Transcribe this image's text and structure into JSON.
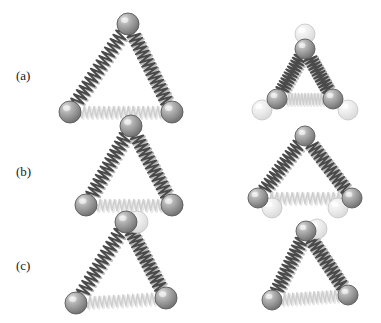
{
  "figure": {
    "title": "",
    "canvas": {
      "width": 381,
      "height": 323,
      "background": "#ffffff"
    },
    "row_labels": [
      {
        "id": "a",
        "text": "(a)",
        "x": 16,
        "y": 68
      },
      {
        "id": "b",
        "text": "(b)",
        "x": 16,
        "y": 164
      },
      {
        "id": "c",
        "text": "(c)",
        "x": 16,
        "y": 258
      }
    ],
    "colors": {
      "atom_dark": "#8c8c8c",
      "atom_dark_edge": "#5a5a5a",
      "atom_highlight": "#d8d8d8",
      "atom_pale": "#e2e2e2",
      "atom_pale_edge": "#bdbdbd",
      "spring_dark": "#4a4a4a",
      "spring_light": "#cfcfcf",
      "label_color": "#1a1a1a"
    },
    "panels": [
      {
        "id": "a-left",
        "row": "a",
        "side": "left",
        "shape": "triangle",
        "atoms": [
          {
            "id": "a-l-top",
            "cx": 128,
            "cy": 24,
            "r": 11,
            "tone": "dark"
          },
          {
            "id": "a-l-bottom-left",
            "cx": 70,
            "cy": 112,
            "r": 11,
            "tone": "dark"
          },
          {
            "id": "a-l-bottom-right",
            "cx": 172,
            "cy": 112,
            "r": 11,
            "tone": "dark"
          }
        ],
        "springs": [
          {
            "from": "a-l-top",
            "to": "a-l-bottom-left",
            "tone": "dark",
            "coils": 17
          },
          {
            "from": "a-l-top",
            "to": "a-l-bottom-right",
            "tone": "dark",
            "coils": 17
          },
          {
            "from": "a-l-bottom-left",
            "to": "a-l-bottom-right",
            "tone": "light",
            "coils": 17
          }
        ]
      },
      {
        "id": "a-right",
        "row": "a",
        "side": "right",
        "shape": "triangle-compressed",
        "atoms": [
          {
            "id": "a-r-top",
            "cx": 305,
            "cy": 49,
            "r": 10,
            "tone": "dark"
          },
          {
            "id": "a-r-bottom-left",
            "cx": 277,
            "cy": 99,
            "r": 10,
            "tone": "dark"
          },
          {
            "id": "a-r-bottom-right",
            "cx": 333,
            "cy": 99,
            "r": 10,
            "tone": "dark"
          },
          {
            "id": "a-r-ghost-left",
            "cx": 262,
            "cy": 110,
            "r": 10,
            "tone": "pale"
          },
          {
            "id": "a-r-ghost-right",
            "cx": 348,
            "cy": 110,
            "r": 10,
            "tone": "pale"
          },
          {
            "id": "a-r-ghost-top",
            "cx": 305,
            "cy": 34,
            "r": 10,
            "tone": "pale"
          }
        ],
        "springs": [
          {
            "from": "a-r-top",
            "to": "a-r-bottom-left",
            "tone": "dark",
            "coils": 12
          },
          {
            "from": "a-r-top",
            "to": "a-r-bottom-right",
            "tone": "dark",
            "coils": 12
          },
          {
            "from": "a-r-bottom-left",
            "to": "a-r-bottom-right",
            "tone": "light",
            "coils": 12
          }
        ]
      },
      {
        "id": "b-left",
        "row": "b",
        "side": "left",
        "shape": "triangle-sheared",
        "atoms": [
          {
            "id": "b-l-top",
            "cx": 131,
            "cy": 126,
            "r": 11,
            "tone": "dark"
          },
          {
            "id": "b-l-bottom-left",
            "cx": 86,
            "cy": 205,
            "r": 11,
            "tone": "dark"
          },
          {
            "id": "b-l-bottom-right",
            "cx": 172,
            "cy": 205,
            "r": 11,
            "tone": "dark"
          }
        ],
        "springs": [
          {
            "from": "b-l-top",
            "to": "b-l-bottom-left",
            "tone": "dark",
            "coils": 15
          },
          {
            "from": "b-l-top",
            "to": "b-l-bottom-right",
            "tone": "dark",
            "coils": 15
          },
          {
            "from": "b-l-bottom-left",
            "to": "b-l-bottom-right",
            "tone": "light",
            "coils": 14
          }
        ]
      },
      {
        "id": "b-right",
        "row": "b",
        "side": "right",
        "shape": "triangle-sheared-mirror",
        "atoms": [
          {
            "id": "b-r-top",
            "cx": 305,
            "cy": 136,
            "r": 10,
            "tone": "dark"
          },
          {
            "id": "b-r-bottom-left",
            "cx": 258,
            "cy": 198,
            "r": 10,
            "tone": "dark"
          },
          {
            "id": "b-r-bottom-right",
            "cx": 352,
            "cy": 198,
            "r": 10,
            "tone": "dark"
          },
          {
            "id": "b-r-ghost-left",
            "cx": 272,
            "cy": 208,
            "r": 10,
            "tone": "pale"
          },
          {
            "id": "b-r-ghost-right",
            "cx": 338,
            "cy": 208,
            "r": 10,
            "tone": "pale"
          }
        ],
        "springs": [
          {
            "from": "b-r-top",
            "to": "b-r-bottom-left",
            "tone": "dark",
            "coils": 14
          },
          {
            "from": "b-r-top",
            "to": "b-r-bottom-right",
            "tone": "dark",
            "coils": 14
          },
          {
            "from": "b-r-bottom-left",
            "to": "b-r-bottom-right",
            "tone": "light",
            "coils": 15
          }
        ]
      },
      {
        "id": "c-left",
        "row": "c",
        "side": "left",
        "shape": "triangle-rotated",
        "atoms": [
          {
            "id": "c-l-top",
            "cx": 126,
            "cy": 222,
            "r": 11,
            "tone": "dark"
          },
          {
            "id": "c-l-bottom-left",
            "cx": 76,
            "cy": 303,
            "r": 11,
            "tone": "dark"
          },
          {
            "id": "c-l-bottom-right",
            "cx": 166,
            "cy": 298,
            "r": 11,
            "tone": "dark"
          },
          {
            "id": "c-l-ghost-top",
            "cx": 137,
            "cy": 222,
            "r": 11,
            "tone": "pale"
          }
        ],
        "springs": [
          {
            "from": "c-l-top",
            "to": "c-l-bottom-left",
            "tone": "dark",
            "coils": 15
          },
          {
            "from": "c-l-top",
            "to": "c-l-bottom-right",
            "tone": "dark",
            "coils": 15
          },
          {
            "from": "c-l-bottom-left",
            "to": "c-l-bottom-right",
            "tone": "light",
            "coils": 15
          }
        ]
      },
      {
        "id": "c-right",
        "row": "c",
        "side": "right",
        "shape": "triangle-rotated-mirror",
        "atoms": [
          {
            "id": "c-r-top",
            "cx": 306,
            "cy": 231,
            "r": 10,
            "tone": "dark"
          },
          {
            "id": "c-r-bottom-left",
            "cx": 272,
            "cy": 300,
            "r": 10,
            "tone": "dark"
          },
          {
            "id": "c-r-bottom-right",
            "cx": 348,
            "cy": 295,
            "r": 10,
            "tone": "dark"
          },
          {
            "id": "c-r-ghost-top",
            "cx": 317,
            "cy": 229,
            "r": 10,
            "tone": "pale"
          }
        ],
        "springs": [
          {
            "from": "c-r-top",
            "to": "c-r-bottom-left",
            "tone": "dark",
            "coils": 14
          },
          {
            "from": "c-r-top",
            "to": "c-r-bottom-right",
            "tone": "dark",
            "coils": 14
          },
          {
            "from": "c-r-bottom-left",
            "to": "c-r-bottom-right",
            "tone": "light",
            "coils": 14
          }
        ]
      }
    ]
  }
}
